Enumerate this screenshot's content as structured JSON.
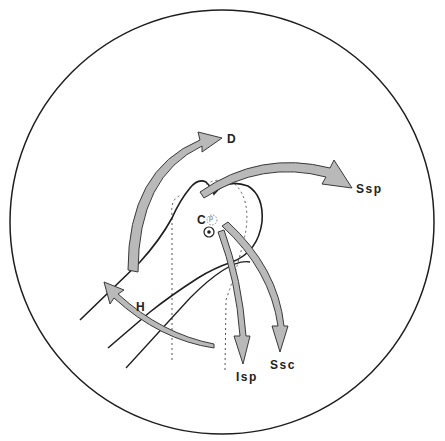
{
  "diagram": {
    "type": "anatomical shoulder diagram",
    "colors": {
      "line": "#1e1e1e",
      "arrow_fill": "#b9b9b9",
      "arrow_stroke": "#3a3a3a",
      "dashed": "#555555",
      "background": "#ffffff"
    },
    "labels": {
      "D": "D",
      "Ssp": "Ssp",
      "C": "C",
      "p": "p",
      "H": "H",
      "Isp": "Isp",
      "Ssc": "Ssc"
    }
  }
}
